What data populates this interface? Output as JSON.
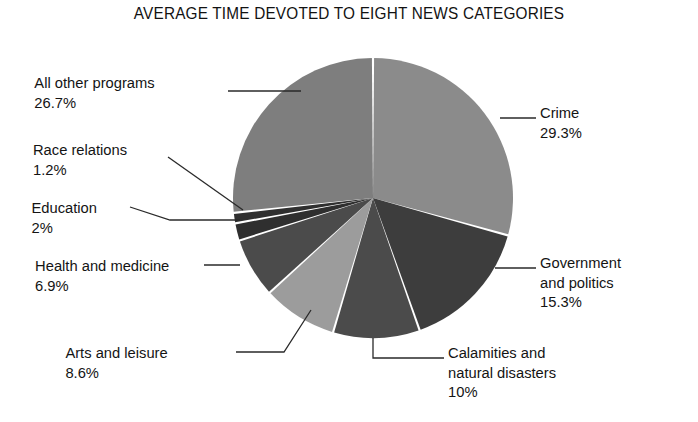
{
  "chart_data": {
    "type": "pie",
    "title": "AVERAGE TIME DEVOTED TO EIGHT NEWS CATEGORIES",
    "xlabel": "",
    "ylabel": "",
    "legend": "none (direct labels with leader lines)",
    "grid": false,
    "units": "percent",
    "start_angle_deg": 0,
    "direction": "clockwise",
    "categories": [
      "Crime",
      "Government and politics",
      "Calamities and natural disasters",
      "Arts and leisure",
      "Health and medicine",
      "Education",
      "Race relations",
      "All other programs"
    ],
    "values": [
      29.3,
      15.3,
      10,
      8.6,
      6.9,
      2,
      1.2,
      26.7
    ],
    "value_labels": [
      "29.3%",
      "15.3%",
      "10%",
      "8.6%",
      "6.9%",
      "2%",
      "1.2%",
      "26.7%"
    ],
    "colors": [
      "#8b8b8b",
      "#3d3d3d",
      "#4b4b4b",
      "#9c9c9c",
      "#4b4b4b",
      "#2f2f2f",
      "#2f2f2f",
      "#7e7e7e"
    ],
    "slice_separator_color": "#ffffff"
  },
  "chart": {
    "title": "AVERAGE TIME DEVOTED TO EIGHT NEWS CATEGORIES",
    "center_x": 373,
    "center_y": 198,
    "radius": 140
  },
  "labels": {
    "crime": {
      "name": "Crime",
      "value": "29.3%"
    },
    "government": {
      "name_line1": "Government",
      "name_line2": "and politics",
      "value": "15.3%"
    },
    "calamities": {
      "name_line1": "Calamities and",
      "name_line2": "natural disasters",
      "value": "10%"
    },
    "arts": {
      "name": "Arts and leisure",
      "value": "8.6%"
    },
    "health": {
      "name": "Health and medicine",
      "value": "6.9%"
    },
    "education": {
      "name": "Education",
      "value": "2%"
    },
    "race": {
      "name": "Race relations",
      "value": "1.2%"
    },
    "allother": {
      "name": "All other programs",
      "value": "26.7%"
    }
  }
}
